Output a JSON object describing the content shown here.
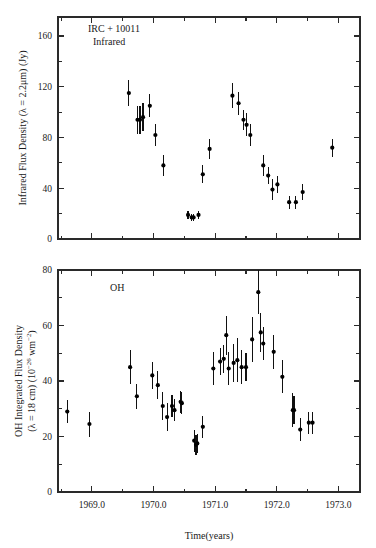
{
  "figure": {
    "background": "#ffffff",
    "ink_color": "#1a1a1a",
    "marker_color": "#000000"
  },
  "panels": {
    "top": {
      "annotation_line1": "IRC + 10011",
      "annotation_line2": "Infrared",
      "ylabel_prefix": "Infrared Flux Density (",
      "ylabel_lambda": "λ",
      "ylabel_mid": " = 2.2",
      "ylabel_mu": "μ",
      "ylabel_suffix": "m) (Jy)",
      "ylabel_full": "Infrared Flux Density (λ = 2.2μm) (Jy)",
      "ytick_labels": [
        "0",
        "40",
        "80",
        "120",
        "160"
      ]
    },
    "bottom": {
      "annotation_line1": "OH",
      "ylabel_line1": "OH Integrated Flux Density",
      "ylabel_line2_a": "(",
      "ylabel_line2_lambda": "λ",
      "ylabel_line2_b": " = 18 cm) (10",
      "ylabel_line2_exp1": "−26",
      "ylabel_line2_c": " wm",
      "ylabel_line2_exp2": "−2",
      "ylabel_line2_d": ")",
      "ylabel_full": "OH Integrated Flux Density (λ = 18 cm) (10⁻²⁶ wm⁻²)",
      "ytick_labels": [
        "0",
        "20",
        "40",
        "60",
        "80"
      ]
    }
  },
  "xaxis": {
    "label": "Time(years)",
    "tick_labels": [
      "1969.0",
      "1970.0",
      "1971.0",
      "1972.0",
      "1973.0"
    ],
    "tick_values": [
      1969.0,
      1970.0,
      1971.0,
      1972.0,
      1973.0
    ],
    "range": [
      1968.45,
      1973.35
    ]
  },
  "chart_data": [
    {
      "type": "scatter",
      "id": "infrared-panel",
      "title": "IRC + 10011 Infrared",
      "xlabel": "Time(years)",
      "ylabel": "Infrared Flux Density (λ = 2.2μm) (Jy)",
      "xlim": [
        1968.45,
        1973.35
      ],
      "ylim": [
        0,
        175
      ],
      "xticks": [
        1969.0,
        1970.0,
        1971.0,
        1972.0,
        1973.0
      ],
      "yticks": [
        0,
        40,
        80,
        120,
        160
      ],
      "grid": false,
      "legend": "none",
      "errorbars": "symmetric-vertical",
      "points": [
        {
          "x": 1969.6,
          "y": 115,
          "yerr": 10
        },
        {
          "x": 1969.74,
          "y": 94,
          "yerr": 11
        },
        {
          "x": 1969.78,
          "y": 94,
          "yerr": 11
        },
        {
          "x": 1969.83,
          "y": 96,
          "yerr": 11
        },
        {
          "x": 1969.94,
          "y": 105,
          "yerr": 9
        },
        {
          "x": 1970.03,
          "y": 82,
          "yerr": 9
        },
        {
          "x": 1970.16,
          "y": 58,
          "yerr": 8
        },
        {
          "x": 1970.56,
          "y": 19,
          "yerr": 3
        },
        {
          "x": 1970.62,
          "y": 17,
          "yerr": 3
        },
        {
          "x": 1970.65,
          "y": 17,
          "yerr": 3
        },
        {
          "x": 1970.73,
          "y": 19,
          "yerr": 3
        },
        {
          "x": 1970.8,
          "y": 51,
          "yerr": 7
        },
        {
          "x": 1970.91,
          "y": 71,
          "yerr": 8
        },
        {
          "x": 1971.28,
          "y": 113,
          "yerr": 10
        },
        {
          "x": 1971.38,
          "y": 107,
          "yerr": 9
        },
        {
          "x": 1971.46,
          "y": 94,
          "yerr": 8
        },
        {
          "x": 1971.51,
          "y": 90,
          "yerr": 9
        },
        {
          "x": 1971.57,
          "y": 82,
          "yerr": 9
        },
        {
          "x": 1971.78,
          "y": 58,
          "yerr": 8
        },
        {
          "x": 1971.86,
          "y": 50,
          "yerr": 7
        },
        {
          "x": 1971.93,
          "y": 39,
          "yerr": 8
        },
        {
          "x": 1972.01,
          "y": 43,
          "yerr": 7
        },
        {
          "x": 1972.2,
          "y": 29,
          "yerr": 5
        },
        {
          "x": 1972.31,
          "y": 29,
          "yerr": 5
        },
        {
          "x": 1972.42,
          "y": 37,
          "yerr": 6
        },
        {
          "x": 1972.9,
          "y": 72,
          "yerr": 7
        }
      ]
    },
    {
      "type": "scatter",
      "id": "oh-panel",
      "title": "OH",
      "xlabel": "Time(years)",
      "ylabel": "OH Integrated Flux Density (λ = 18 cm) (10⁻²⁶ wm⁻²)",
      "xlim": [
        1968.45,
        1973.35
      ],
      "ylim": [
        0,
        80
      ],
      "xticks": [
        1969.0,
        1970.0,
        1971.0,
        1972.0,
        1973.0
      ],
      "yticks": [
        0,
        20,
        40,
        60,
        80
      ],
      "grid": false,
      "legend": "none",
      "errorbars": "symmetric-vertical",
      "points": [
        {
          "x": 1968.6,
          "y": 29,
          "yerr": 4
        },
        {
          "x": 1968.96,
          "y": 24.5,
          "yerr": 4.5
        },
        {
          "x": 1969.62,
          "y": 45,
          "yerr": 6
        },
        {
          "x": 1969.73,
          "y": 34.5,
          "yerr": 4.5
        },
        {
          "x": 1969.98,
          "y": 42,
          "yerr": 5
        },
        {
          "x": 1970.07,
          "y": 38.5,
          "yerr": 5
        },
        {
          "x": 1970.15,
          "y": 31,
          "yerr": 5
        },
        {
          "x": 1970.22,
          "y": 27,
          "yerr": 5
        },
        {
          "x": 1970.3,
          "y": 31,
          "yerr": 4
        },
        {
          "x": 1970.34,
          "y": 29.5,
          "yerr": 4
        },
        {
          "x": 1970.44,
          "y": 32.5,
          "yerr": 4
        },
        {
          "x": 1970.46,
          "y": 32,
          "yerr": 4
        },
        {
          "x": 1970.66,
          "y": 18.5,
          "yerr": 4
        },
        {
          "x": 1970.69,
          "y": 17,
          "yerr": 3.5
        },
        {
          "x": 1970.71,
          "y": 17.5,
          "yerr": 3.5
        },
        {
          "x": 1970.8,
          "y": 23.5,
          "yerr": 4
        },
        {
          "x": 1970.97,
          "y": 44.5,
          "yerr": 6
        },
        {
          "x": 1971.08,
          "y": 47,
          "yerr": 5
        },
        {
          "x": 1971.14,
          "y": 48,
          "yerr": 5
        },
        {
          "x": 1971.18,
          "y": 56.5,
          "yerr": 7
        },
        {
          "x": 1971.22,
          "y": 44.5,
          "yerr": 6
        },
        {
          "x": 1971.3,
          "y": 46.5,
          "yerr": 7
        },
        {
          "x": 1971.36,
          "y": 47.5,
          "yerr": 8
        },
        {
          "x": 1971.43,
          "y": 45,
          "yerr": 6
        },
        {
          "x": 1971.5,
          "y": 45,
          "yerr": 5
        },
        {
          "x": 1971.6,
          "y": 55,
          "yerr": 8
        },
        {
          "x": 1971.7,
          "y": 72,
          "yerr": 8
        },
        {
          "x": 1971.74,
          "y": 57.5,
          "yerr": 7
        },
        {
          "x": 1971.78,
          "y": 53.5,
          "yerr": 6
        },
        {
          "x": 1971.95,
          "y": 50.5,
          "yerr": 6
        },
        {
          "x": 1972.09,
          "y": 41.5,
          "yerr": 6
        },
        {
          "x": 1972.26,
          "y": 29.5,
          "yerr": 6
        },
        {
          "x": 1972.28,
          "y": 29.5,
          "yerr": 5
        },
        {
          "x": 1972.38,
          "y": 22.5,
          "yerr": 4
        },
        {
          "x": 1972.52,
          "y": 25,
          "yerr": 4
        },
        {
          "x": 1972.58,
          "y": 25,
          "yerr": 4
        }
      ]
    }
  ]
}
